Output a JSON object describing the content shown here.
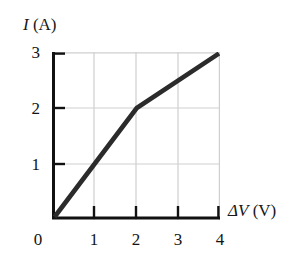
{
  "figure": {
    "background_color": "#ffffff",
    "line_color": "#2b2b2b",
    "axis_color": "#111111",
    "grid_color": "#cfcfcf"
  },
  "axes": {
    "y_title_symbol": "I",
    "y_title_unit": " (A)",
    "x_title_symbol": "ΔV",
    "x_title_unit": " (V)",
    "x_ticks": [
      "0",
      "1",
      "2",
      "3",
      "4"
    ],
    "y_ticks": [
      "1",
      "2",
      "3"
    ],
    "origin_label": "0"
  },
  "chart_data": {
    "type": "line",
    "title": "",
    "xlabel": "ΔV (V)",
    "ylabel": "I (A)",
    "xlim": [
      0,
      4
    ],
    "ylim": [
      0,
      3
    ],
    "xticks": [
      0,
      1,
      2,
      3,
      4
    ],
    "yticks": [
      0,
      1,
      2,
      3
    ],
    "grid": true,
    "legend": false,
    "series": [
      {
        "name": "I vs ΔV",
        "x": [
          0,
          2,
          4
        ],
        "y": [
          0,
          2,
          3
        ]
      }
    ],
    "annotations": []
  }
}
